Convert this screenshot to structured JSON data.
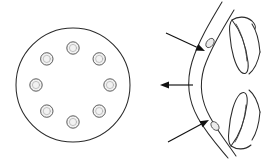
{
  "figure": {
    "width": 268,
    "height": 164,
    "background": "#ffffff",
    "ink_color": "#2b2b2b",
    "arrow_color": "#111111",
    "fill_color": "#f0f0f0",
    "panel_count": 2,
    "style": "line-drawing"
  },
  "left_panel": {
    "name": "cross-section-view",
    "outer_circle": {
      "cx": 73,
      "cy": 85,
      "r": 57,
      "stroke": "#2b2b2b",
      "fill": "none"
    },
    "pore_count": 8,
    "pore_radius": 6.2,
    "pore_fill": "#f2f2f2",
    "pore_ring_radius": 37,
    "pores": [
      {
        "label": "pore-1",
        "cx": 73,
        "cy": 48,
        "angle_deg": 270
      },
      {
        "label": "pore-2",
        "cx": 99.2,
        "cy": 58.9,
        "angle_deg": 315
      },
      {
        "label": "pore-3",
        "cx": 110,
        "cy": 85,
        "angle_deg": 0
      },
      {
        "label": "pore-4",
        "cx": 99.2,
        "cy": 111.1,
        "angle_deg": 45
      },
      {
        "label": "pore-5",
        "cx": 73,
        "cy": 122,
        "angle_deg": 90
      },
      {
        "label": "pore-6",
        "cx": 46.8,
        "cy": 111.1,
        "angle_deg": 135
      },
      {
        "label": "pore-7",
        "cx": 36,
        "cy": 85,
        "angle_deg": 180
      },
      {
        "label": "pore-8",
        "cx": 46.8,
        "cy": 58.9,
        "angle_deg": 225
      }
    ]
  },
  "right_panel": {
    "name": "sagittal-section-view",
    "curves": [
      {
        "label": "anterior-outer-contour",
        "d": "M 222 2 C 210 22 198 42 192 62 C 186 82 188 100 198 118 C 207 134 218 146 228 158"
      },
      {
        "label": "anterior-inner-contour",
        "d": "M 234 10 C 222 30 210 50 204 68 C 199 85 201 101 210 117 C 218 132 228 144 236 156"
      },
      {
        "label": "upper-leaflet-outer",
        "d": "M 232 20 C 240 30 246 46 248 62 C 249 72 246 76 241 72 C 235 66 231 50 230 36 C 229 28 230 22 232 20 Z"
      },
      {
        "label": "lower-leaflet-outer",
        "d": "M 231 146 C 239 136 245 120 247 104 C 248 94 245 90 240 94 C 234 100 230 116 229 130 C 228 138 229 144 231 146 Z"
      },
      {
        "label": "upper-leaflet-inner",
        "d": "M 236 24 C 242 34 246 48 247 61"
      },
      {
        "label": "lower-leaflet-inner",
        "d": "M 235 142 C 241 132 245 118 246 105"
      },
      {
        "label": "upper-cusp-tip",
        "d": "M 232 20 C 238 16 246 16 252 21 C 255 24 256 27 255 29"
      },
      {
        "label": "upper-commissure-line",
        "d": "M 252 24 C 256 30 259 40 260 52"
      },
      {
        "label": "lower-commissure-line",
        "d": "M 252 140 C 256 134 259 124 260 112"
      },
      {
        "label": "lower-cusp-tip",
        "d": "M 231 146 C 237 150 245 150 251 145"
      },
      {
        "label": "upper-hinge-stem",
        "d": "M 260 52 C 258 62 254 70 249 74"
      },
      {
        "label": "lower-hinge-stem",
        "d": "M 260 112 C 258 102 254 94 249 90"
      }
    ],
    "nodules": [
      {
        "label": "upper-nodule",
        "cx": 210,
        "cy": 43,
        "rx": 5.2,
        "ry": 3.4,
        "rotate": -52
      },
      {
        "label": "lower-nodule",
        "cx": 215,
        "cy": 126,
        "rx": 5.0,
        "ry": 3.3,
        "rotate": 50
      }
    ],
    "arrows": [
      {
        "label": "upper-arrow",
        "direction": "down-right",
        "tail_x": 166,
        "tail_y": 33,
        "tip_x": 205,
        "tip_y": 51
      },
      {
        "label": "middle-arrow",
        "direction": "left",
        "tail_x": 193,
        "tail_y": 85,
        "tip_x": 160,
        "tip_y": 85
      },
      {
        "label": "lower-arrow",
        "direction": "up-right",
        "tail_x": 168,
        "tail_y": 142,
        "tip_x": 209,
        "tip_y": 120
      }
    ]
  }
}
